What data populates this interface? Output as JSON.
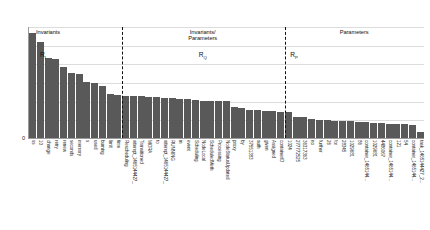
{
  "chart_data": {
    "type": "bar",
    "title": "",
    "xlabel": "",
    "ylabel": "",
    "ylim": [
      0,
      1200
    ],
    "yticks": [
      0,
      200,
      400,
      600,
      800,
      1000,
      1200
    ],
    "grid": true,
    "legend": null,
    "bar_color": "#595959",
    "categories": [
      "ss",
      "10",
      "change",
      "retry",
      "renew",
      "seconds",
      "memory",
      "s",
      "used",
      "burning",
      "limit",
      "time",
      "Rescheduling",
      "attempt_1465144427_",
      "Transitioned",
      "MORA",
      "to",
      "attempt_1465144427_",
      "RUNNING",
      "in",
      "event",
      "Scheduling",
      "NodeLocal",
      "ScheduledMeth",
      "Processing",
      "NodeStatusUpdated",
      "proxy",
      "by",
      "37551383",
      "auth",
      "given",
      "Assigned",
      "containerID",
      "1024",
      "277772525",
      "36317363",
      "no",
      "further",
      "26",
      "for",
      "28345",
      "1029681",
      "86",
      "container_1465144...",
      "1029681",
      "4486067",
      "container_1465144...",
      "121",
      "54",
      "container_1465144...",
      "task_1465144427_2..."
    ],
    "values": [
      1120,
      1030,
      860,
      845,
      760,
      700,
      690,
      600,
      585,
      560,
      470,
      460,
      455,
      450,
      445,
      440,
      435,
      430,
      425,
      420,
      415,
      405,
      400,
      398,
      396,
      392,
      330,
      320,
      300,
      295,
      290,
      285,
      280,
      275,
      230,
      225,
      200,
      195,
      190,
      185,
      182,
      178,
      175,
      170,
      165,
      160,
      155,
      150,
      145,
      140,
      60
    ],
    "regions": [
      {
        "title": "Invariants",
        "symbol_base": "R",
        "symbol_sub": "I",
        "start_index": 0,
        "end_index": 12
      },
      {
        "title": "Invariants/\nParameters",
        "title_line1": "Invariants/",
        "title_line2": "Parameters",
        "symbol_base": "R",
        "symbol_sub": "Q",
        "start_index": 12,
        "end_index": 33
      },
      {
        "title": "Parameters",
        "symbol_base": "R",
        "symbol_sub": "P",
        "start_index": 33,
        "end_index": 51
      }
    ],
    "separator_positions": [
      12,
      33
    ]
  }
}
